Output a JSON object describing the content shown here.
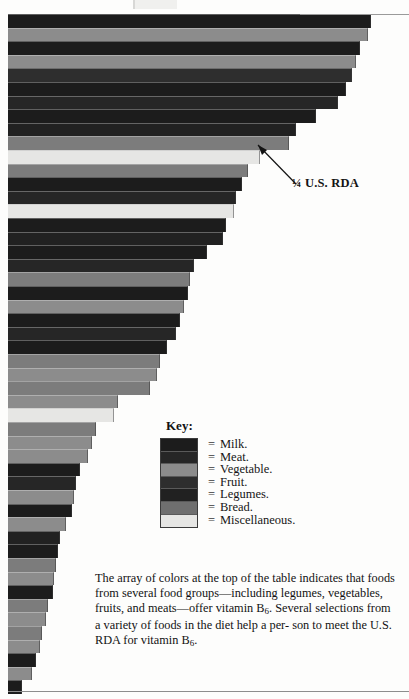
{
  "page": {
    "width": 409,
    "height": 699
  },
  "annotation": {
    "rda_label": "¼ U.S. RDA",
    "pointer": "arrow-up-left"
  },
  "key": {
    "title": "Key:",
    "equals": "=",
    "items": [
      {
        "label": "Milk.",
        "group": "Milk",
        "color": "#1c1c1c"
      },
      {
        "label": "Meat.",
        "group": "Meat",
        "color": "#262626"
      },
      {
        "label": "Vegetable.",
        "group": "Vegetable",
        "color": "#8c8c8c"
      },
      {
        "label": "Fruit.",
        "group": "Fruit",
        "color": "#2e2e2e"
      },
      {
        "label": "Legumes.",
        "group": "Legumes",
        "color": "#212121"
      },
      {
        "label": "Bread.",
        "group": "Bread",
        "color": "#6f6f6f"
      },
      {
        "label": "Miscellaneous.",
        "group": "Miscellaneous",
        "color": "#e6e6e4"
      }
    ]
  },
  "caption": {
    "line1": "The array of colors at the top of the table indicates that",
    "line2": "foods from several food groups—including legumes,",
    "line3_a": "vegetables, fruits, and meats—offer vitamin B",
    "line3_sub": "6",
    "line3_b": ". Several",
    "line4": "selections from a variety of foods in the diet help a per-",
    "line5_a": "son to meet the U.S. RDA for vitamin B",
    "line5_sub": "6",
    "line5_b": "."
  },
  "chart_data": {
    "type": "bar",
    "orientation": "horizontal",
    "xlabel": "",
    "ylabel": "",
    "grid": false,
    "legend_position": "inside-center-right",
    "annotations": [
      {
        "text": "¼ U.S. RDA",
        "points_to_bar_index": 12,
        "x_px": 292,
        "y_px": 176
      }
    ],
    "axis_note": "Bars share a common left baseline at x=8px; bar length encodes vitamin B6 amount. Widths given in pixels of the original 409px-wide figure.",
    "bar_height_px": 13.6,
    "categories_note": "Individual food names are not printed in this crop; bars are identified only by food-group color.",
    "bars": [
      {
        "i": 0,
        "group": "Milk",
        "color": "#1c1c1c",
        "width_px": 363,
        "top_px": 14.0
      },
      {
        "i": 1,
        "group": "Vegetable",
        "color": "#8c8c8c",
        "width_px": 360,
        "top_px": 27.6
      },
      {
        "i": 2,
        "group": "Milk",
        "color": "#1c1c1c",
        "width_px": 352,
        "top_px": 41.2
      },
      {
        "i": 3,
        "group": "Vegetable",
        "color": "#8c8c8c",
        "width_px": 348,
        "top_px": 54.8
      },
      {
        "i": 4,
        "group": "Fruit",
        "color": "#2e2e2e",
        "width_px": 344,
        "top_px": 68.4
      },
      {
        "i": 5,
        "group": "Milk",
        "color": "#1c1c1c",
        "width_px": 338,
        "top_px": 82.0
      },
      {
        "i": 6,
        "group": "Meat",
        "color": "#262626",
        "width_px": 330,
        "top_px": 95.6
      },
      {
        "i": 7,
        "group": "Milk",
        "color": "#1c1c1c",
        "width_px": 308,
        "top_px": 109.2
      },
      {
        "i": 8,
        "group": "Legumes",
        "color": "#212121",
        "width_px": 288,
        "top_px": 122.8
      },
      {
        "i": 9,
        "group": "Bread",
        "color": "#7c7c7c",
        "width_px": 281,
        "top_px": 136.4
      },
      {
        "i": 10,
        "group": "Miscellaneous",
        "color": "#e6e6e4",
        "width_px": 252,
        "top_px": 150.0
      },
      {
        "i": 11,
        "group": "Bread",
        "color": "#7c7c7c",
        "width_px": 240,
        "top_px": 163.6
      },
      {
        "i": 12,
        "group": "Milk",
        "color": "#1c1c1c",
        "width_px": 234,
        "top_px": 177.2
      },
      {
        "i": 13,
        "group": "Meat",
        "color": "#262626",
        "width_px": 228,
        "top_px": 190.8
      },
      {
        "i": 14,
        "group": "Miscellaneous",
        "color": "#e6e6e4",
        "width_px": 226,
        "top_px": 204.4
      },
      {
        "i": 15,
        "group": "Milk",
        "color": "#1c1c1c",
        "width_px": 218,
        "top_px": 218.0
      },
      {
        "i": 16,
        "group": "Legumes",
        "color": "#212121",
        "width_px": 215,
        "top_px": 231.6
      },
      {
        "i": 17,
        "group": "Milk",
        "color": "#1c1c1c",
        "width_px": 199,
        "top_px": 245.2
      },
      {
        "i": 18,
        "group": "Meat",
        "color": "#262626",
        "width_px": 186,
        "top_px": 258.8
      },
      {
        "i": 19,
        "group": "Bread",
        "color": "#7c7c7c",
        "width_px": 182,
        "top_px": 272.4
      },
      {
        "i": 20,
        "group": "Milk",
        "color": "#1c1c1c",
        "width_px": 180,
        "top_px": 286.0
      },
      {
        "i": 21,
        "group": "Vegetable",
        "color": "#8c8c8c",
        "width_px": 176,
        "top_px": 299.6
      },
      {
        "i": 22,
        "group": "Milk",
        "color": "#1c1c1c",
        "width_px": 172,
        "top_px": 313.2
      },
      {
        "i": 23,
        "group": "Meat",
        "color": "#262626",
        "width_px": 168,
        "top_px": 326.8
      },
      {
        "i": 24,
        "group": "Milk",
        "color": "#1c1c1c",
        "width_px": 159,
        "top_px": 340.4
      },
      {
        "i": 25,
        "group": "Bread",
        "color": "#7c7c7c",
        "width_px": 152,
        "top_px": 354.0
      },
      {
        "i": 26,
        "group": "Vegetable",
        "color": "#8c8c8c",
        "width_px": 149,
        "top_px": 367.6
      },
      {
        "i": 27,
        "group": "Bread",
        "color": "#7c7c7c",
        "width_px": 142,
        "top_px": 381.2
      },
      {
        "i": 28,
        "group": "Vegetable",
        "color": "#8c8c8c",
        "width_px": 110,
        "top_px": 394.8
      },
      {
        "i": 29,
        "group": "Miscellaneous",
        "color": "#e6e6e4",
        "width_px": 106,
        "top_px": 408.4
      },
      {
        "i": 30,
        "group": "Bread",
        "color": "#7c7c7c",
        "width_px": 88,
        "top_px": 422.0
      },
      {
        "i": 31,
        "group": "Vegetable",
        "color": "#8c8c8c",
        "width_px": 84,
        "top_px": 435.6
      },
      {
        "i": 32,
        "group": "Vegetable",
        "color": "#8c8c8c",
        "width_px": 80,
        "top_px": 449.2
      },
      {
        "i": 33,
        "group": "Milk",
        "color": "#1c1c1c",
        "width_px": 72,
        "top_px": 462.8
      },
      {
        "i": 34,
        "group": "Meat",
        "color": "#262626",
        "width_px": 68,
        "top_px": 476.4
      },
      {
        "i": 35,
        "group": "Vegetable",
        "color": "#8c8c8c",
        "width_px": 66,
        "top_px": 490.0
      },
      {
        "i": 36,
        "group": "Milk",
        "color": "#1c1c1c",
        "width_px": 64,
        "top_px": 503.6
      },
      {
        "i": 37,
        "group": "Vegetable",
        "color": "#8c8c8c",
        "width_px": 58,
        "top_px": 517.2
      },
      {
        "i": 38,
        "group": "Legumes",
        "color": "#212121",
        "width_px": 52,
        "top_px": 530.8
      },
      {
        "i": 39,
        "group": "Milk",
        "color": "#1c1c1c",
        "width_px": 50,
        "top_px": 544.4
      },
      {
        "i": 40,
        "group": "Bread",
        "color": "#7c7c7c",
        "width_px": 48,
        "top_px": 558.0
      },
      {
        "i": 41,
        "group": "Vegetable",
        "color": "#8c8c8c",
        "width_px": 46,
        "top_px": 571.6
      },
      {
        "i": 42,
        "group": "Milk",
        "color": "#1c1c1c",
        "width_px": 45,
        "top_px": 585.2
      },
      {
        "i": 43,
        "group": "Bread",
        "color": "#7c7c7c",
        "width_px": 40,
        "top_px": 598.8
      },
      {
        "i": 44,
        "group": "Vegetable",
        "color": "#8c8c8c",
        "width_px": 38,
        "top_px": 612.4
      },
      {
        "i": 45,
        "group": "Bread",
        "color": "#7c7c7c",
        "width_px": 34,
        "top_px": 626.0
      },
      {
        "i": 46,
        "group": "Vegetable",
        "color": "#8c8c8c",
        "width_px": 32,
        "top_px": 639.6
      },
      {
        "i": 47,
        "group": "Milk",
        "color": "#1c1c1c",
        "width_px": 28,
        "top_px": 653.2
      },
      {
        "i": 48,
        "group": "Vegetable",
        "color": "#8c8c8c",
        "width_px": 24,
        "top_px": 666.8
      },
      {
        "i": 49,
        "group": "Milk",
        "color": "#1c1c1c",
        "width_px": 14,
        "top_px": 680.4
      }
    ]
  }
}
